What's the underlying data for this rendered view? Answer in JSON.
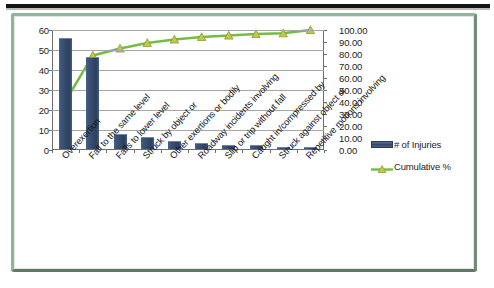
{
  "chart_data": {
    "type": "bar",
    "title": "",
    "subtitle": "",
    "xlabel": "",
    "ylabel": "",
    "grid": true,
    "legend_position": "right",
    "categories": [
      "Overexertion",
      "Fall to the same level",
      "Falls to lower level",
      "Struck by object or",
      "Other exertions or bodily",
      "Roadway incidents involving",
      "Slip or trip without fall",
      "Caught in/compressed by",
      "Struck against object or",
      "Repetitive motions involving"
    ],
    "series": [
      {
        "name": "# of Injuries",
        "type": "bar",
        "axis": "left",
        "color": "#3a5070",
        "values": [
          55,
          45.5,
          7,
          5.5,
          3.5,
          2.5,
          1.5,
          1.5,
          0.7,
          0.7
        ]
      },
      {
        "name": "Cumulative %",
        "type": "line",
        "axis": "right",
        "color": "#76bc43",
        "marker_color": "#c0c84a",
        "values": [
          41.0,
          78.8,
          84.6,
          89.2,
          92.1,
          94.2,
          95.4,
          96.7,
          97.3,
          100.0
        ]
      }
    ],
    "y_left": {
      "min": 0,
      "max": 60,
      "step": 10,
      "ticks": [
        "0",
        "10",
        "20",
        "30",
        "40",
        "50",
        "60"
      ]
    },
    "y_right": {
      "min": 0,
      "max": 100,
      "step": 10,
      "ticks": [
        "0.00",
        "10.00",
        "20.00",
        "30.00",
        "40.00",
        "50.00",
        "60.00",
        "70.00",
        "80.00",
        "90.00",
        "100.00"
      ]
    }
  },
  "legend": {
    "items": [
      {
        "label": "# of Injuries",
        "icon": "bar-swatch-icon"
      },
      {
        "label": "Cumulative %",
        "icon": "line-marker-swatch-icon"
      }
    ]
  },
  "colors": {
    "bar": "#3a5070",
    "line": "#76bc43",
    "marker": "#c0c84a",
    "frame": "#8fb69a",
    "gridline": "#a6a6a6",
    "axis": "#6e6e6e",
    "top_rule": "#141414"
  }
}
